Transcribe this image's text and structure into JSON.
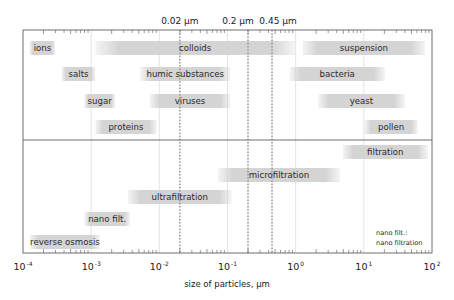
{
  "chart_data": {
    "type": "bar",
    "subtype": "floating-range (log scale)",
    "title": "",
    "xlabel": "size of particles, µm",
    "ylabel": "",
    "xscale": "log10",
    "xlim_log10": [
      -4,
      2
    ],
    "x_tick_labels": [
      {
        "base": "10",
        "exp": "-4",
        "log10": -4
      },
      {
        "base": "10",
        "exp": "-3",
        "log10": -3
      },
      {
        "base": "10",
        "exp": "-2",
        "log10": -2
      },
      {
        "base": "10",
        "exp": "-1",
        "log10": -1
      },
      {
        "base": "10",
        "exp": "0",
        "log10": 0
      },
      {
        "base": "10",
        "exp": "1",
        "log10": 1
      },
      {
        "base": "10",
        "exp": "2",
        "log10": 2
      }
    ],
    "grid": "vertical lines at each decade",
    "reference_lines": [
      {
        "label": "0.02 µm",
        "value_um": 0.02
      },
      {
        "label": "0.2 µm",
        "value_um": 0.2
      },
      {
        "label": "0.45 µm",
        "value_um": 0.45
      }
    ],
    "panels": [
      {
        "name": "particles",
        "rows": [
          [
            {
              "label": "ions",
              "from_log10": -3.9,
              "to_log10": -3.53
            },
            {
              "label": "colloids",
              "from_log10": -2.94,
              "to_log10": -0.01
            },
            {
              "label": "suspension",
              "from_log10": 0.1,
              "to_log10": 1.9
            }
          ],
          [
            {
              "label": "salts",
              "from_log10": -3.43,
              "to_log10": -2.94
            },
            {
              "label": "humic substances",
              "from_log10": -2.28,
              "to_log10": -0.96
            },
            {
              "label": "bacteria",
              "from_log10": -0.09,
              "to_log10": 1.31
            }
          ],
          [
            {
              "label": "sugar",
              "from_log10": -3.1,
              "to_log10": -2.65
            },
            {
              "label": "viruses",
              "from_log10": -2.14,
              "to_log10": -0.96
            },
            {
              "label": "yeast",
              "from_log10": 0.33,
              "to_log10": 1.6
            }
          ],
          [
            {
              "label": "proteins",
              "from_log10": -2.94,
              "to_log10": -2.04
            },
            {
              "label": "pollen",
              "from_log10": 1.01,
              "to_log10": 1.79
            }
          ]
        ]
      },
      {
        "name": "processes",
        "rows": [
          [
            {
              "label": "filtration",
              "from_log10": 0.69,
              "to_log10": 1.94
            }
          ],
          [
            {
              "label": "microfiltration",
              "from_log10": -1.14,
              "to_log10": 0.65
            }
          ],
          [
            {
              "label": "ultrafiltration",
              "from_log10": -2.46,
              "to_log10": -0.94
            }
          ],
          [
            {
              "label": "nano filt.",
              "from_log10": -3.1,
              "to_log10": -2.43
            }
          ],
          [
            {
              "label": "reverse osmosis",
              "from_log10": -3.9,
              "to_log10": -2.87
            }
          ]
        ]
      }
    ],
    "annotations": [
      "nano filt.:",
      "nano filtration"
    ],
    "legend": "none"
  },
  "colors": {
    "bar_fill": "#d4d4d4",
    "frame": "#6e6e6e",
    "grid": "#dcdcdc",
    "ref_line": "#9a9a9a",
    "text": "#2a2a2a"
  }
}
